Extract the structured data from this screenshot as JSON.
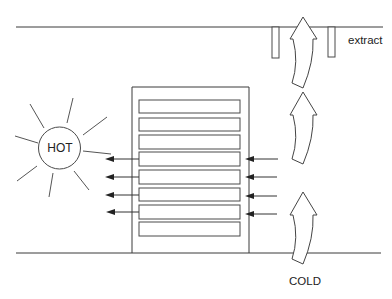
{
  "diagram": {
    "title": "",
    "labels": {
      "extract": "extract",
      "hot": "HOT",
      "cold": "COLD"
    },
    "elements": {
      "ceiling": "ceiling line",
      "floor": "floor line",
      "rack": "server rack",
      "rack_slots": 8,
      "extract_vents": 2,
      "airflow_arrows_up": 3,
      "hot_exhaust_arrows": 4,
      "cold_intake_arrows": 4,
      "heat_source": "sun (HOT)"
    },
    "colors": {
      "line": "#3a3a3a",
      "background": "#ffffff",
      "text": "#222222"
    }
  }
}
